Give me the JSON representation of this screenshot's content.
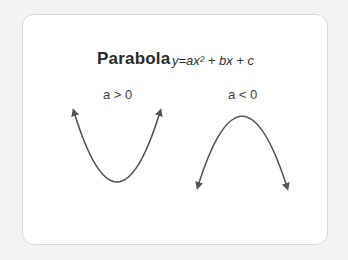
{
  "diagram": {
    "title": "Parabola",
    "formula": "y=ax² + bx + c",
    "curves": [
      {
        "label": "a > 0",
        "orientation": "opens-up",
        "left_tip": [
          74,
          112
        ],
        "vertex": [
          117,
          182
        ],
        "right_tip": [
          160,
          112
        ]
      },
      {
        "label": "a < 0",
        "orientation": "opens-down",
        "left_tip": [
          198,
          186
        ],
        "vertex": [
          241,
          116
        ],
        "right_tip": [
          287,
          187
        ]
      }
    ],
    "colors": {
      "background": "#f3f3f3",
      "card": "#ffffff",
      "card_border": "#d9d9d9",
      "curve": "#555555",
      "title": "#2b2b2b"
    }
  }
}
